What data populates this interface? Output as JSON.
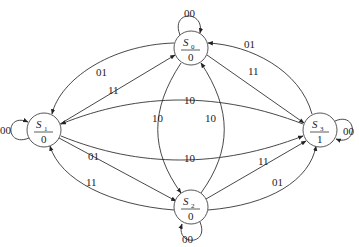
{
  "diagram": {
    "type": "state-machine",
    "states": [
      {
        "id": "S0",
        "name": "S",
        "sub": "0",
        "output": "0"
      },
      {
        "id": "S1",
        "name": "S",
        "sub": "1",
        "output": "0"
      },
      {
        "id": "S2",
        "name": "S",
        "sub": "2",
        "output": "0"
      },
      {
        "id": "S3",
        "name": "S",
        "sub": "3",
        "output": "1"
      }
    ],
    "transitions": [
      {
        "from": "S0",
        "to": "S0",
        "label": "00"
      },
      {
        "from": "S1",
        "to": "S1",
        "label": "00"
      },
      {
        "from": "S2",
        "to": "S2",
        "label": "00"
      },
      {
        "from": "S3",
        "to": "S3",
        "label": "00"
      },
      {
        "from": "S0",
        "to": "S1",
        "label": "01"
      },
      {
        "from": "S1",
        "to": "S0",
        "label": "11"
      },
      {
        "from": "S3",
        "to": "S0",
        "label": "01"
      },
      {
        "from": "S0",
        "to": "S3",
        "label": "11"
      },
      {
        "from": "S3",
        "to": "S1",
        "label": "10"
      },
      {
        "from": "S1",
        "to": "S3",
        "label": "10"
      },
      {
        "from": "S0",
        "to": "S2",
        "label": "10"
      },
      {
        "from": "S2",
        "to": "S0",
        "label": "10"
      },
      {
        "from": "S1",
        "to": "S2",
        "label": "01"
      },
      {
        "from": "S2",
        "to": "S1",
        "label": "11"
      },
      {
        "from": "S2",
        "to": "S3",
        "label": "11"
      },
      {
        "from": "S2",
        "to": "S3",
        "label": "01"
      }
    ]
  }
}
